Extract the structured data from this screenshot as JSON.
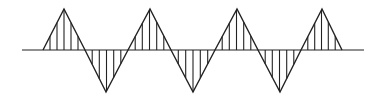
{
  "diagram": {
    "type": "hatched-triangle-wave",
    "colors": {
      "stroke": "#222222",
      "background": "#ffffff"
    },
    "axis": {
      "x_start": 22,
      "x_end": 364,
      "y": 50
    },
    "wave": {
      "zero_crossings": [
        43,
        85,
        128,
        171,
        215,
        258,
        301,
        342
      ],
      "vertices": [
        {
          "x": 64,
          "y": 9,
          "kind": "peak"
        },
        {
          "x": 106,
          "y": 92,
          "kind": "trough"
        },
        {
          "x": 150,
          "y": 9,
          "kind": "peak"
        },
        {
          "x": 193,
          "y": 92,
          "kind": "trough"
        },
        {
          "x": 237,
          "y": 9,
          "kind": "peak"
        },
        {
          "x": 280,
          "y": 92,
          "kind": "trough"
        },
        {
          "x": 322,
          "y": 9,
          "kind": "peak"
        }
      ],
      "hatch_lines_per_lobe": 5
    }
  }
}
